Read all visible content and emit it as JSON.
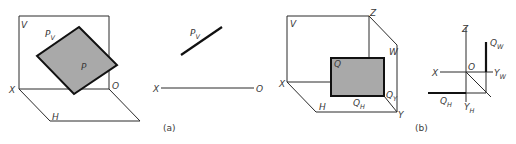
{
  "figure": {
    "panel_a": {
      "caption": "(a)",
      "pictorial": {
        "labels": {
          "v": "V",
          "pv": "P",
          "pv_sub": "V",
          "p": "P",
          "x": "X",
          "o": "O",
          "h": "H"
        }
      },
      "projection": {
        "labels": {
          "pv": "P",
          "pv_sub": "V",
          "x": "X",
          "o": "O"
        }
      }
    },
    "panel_b": {
      "caption": "(b)",
      "pictorial": {
        "labels": {
          "v": "V",
          "z": "Z",
          "w": "W",
          "q": "Q",
          "x": "X",
          "h": "H",
          "qh": "Q",
          "qh_sub": "H",
          "qy": "Q",
          "qy_sub": "Y",
          "y": "Y"
        }
      },
      "projection": {
        "labels": {
          "z": "Z",
          "x": "X",
          "o": "O",
          "yw": "Y",
          "yw_sub": "W",
          "yh": "Y",
          "yh_sub": "H",
          "qw": "Q",
          "qw_sub": "W",
          "qh": "Q",
          "qh_sub": "H"
        }
      }
    },
    "colors": {
      "plane_fill": "#a9a9a9",
      "line": "#111111",
      "label": "#3a3a3a",
      "background": "#ffffff"
    }
  }
}
